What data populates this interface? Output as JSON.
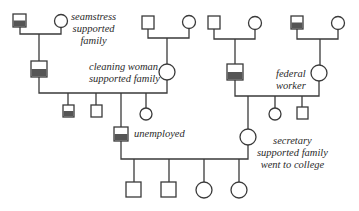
{
  "diagram": {
    "type": "pedigree-chart",
    "colors": {
      "line": "#3a3a3a",
      "shade": "#555555",
      "background": "#ffffff"
    },
    "legend_shapes": {
      "square": "male",
      "circle": "female",
      "half-shaded-square": "affected male (lower half shaded)"
    },
    "labels": {
      "seamstress": [
        "seamstress",
        "supported",
        "family"
      ],
      "cleaning_woman": [
        "cleaning woman",
        "supported family"
      ],
      "federal_worker": [
        "federal",
        "worker"
      ],
      "unemployed": [
        "unemployed"
      ],
      "secretary": [
        "secretary",
        "supported family",
        "went to college"
      ]
    },
    "generations": [
      {
        "level": 1,
        "couples": [
          {
            "male": {
              "shaded": true
            },
            "female": {
              "note": "seamstress supported family"
            }
          },
          {
            "male": {
              "shaded": false
            },
            "female": {}
          },
          {
            "male": {
              "shaded": false
            },
            "female": {}
          },
          {
            "male": {
              "shaded": true
            },
            "female": {}
          }
        ]
      },
      {
        "level": 2,
        "couples": [
          {
            "male": {
              "shaded": true
            },
            "female": {
              "note": "cleaning woman supported family"
            }
          },
          {
            "male": {
              "shaded": true
            },
            "female": {
              "note": "federal worker"
            }
          }
        ]
      },
      {
        "level": 3,
        "siblings_left": [
          "male-shaded",
          "male",
          "male-shaded (unemployed)",
          "female"
        ],
        "siblings_right": [
          "female (secretary)",
          "female",
          "male"
        ]
      },
      {
        "level": 4,
        "children": [
          "male",
          "male",
          "female",
          "female"
        ]
      }
    ]
  }
}
